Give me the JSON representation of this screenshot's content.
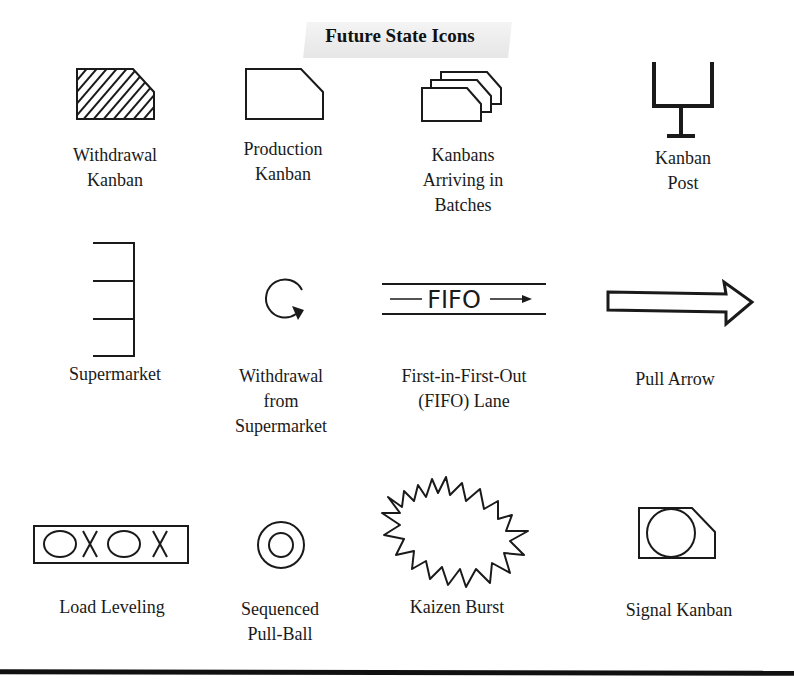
{
  "title": "Future State Icons",
  "icons": [
    {
      "id": "withdrawal-kanban",
      "label_lines": [
        "Withdrawal",
        "Kanban"
      ]
    },
    {
      "id": "production-kanban",
      "label_lines": [
        "Production",
        "Kanban"
      ]
    },
    {
      "id": "kanbans-arriving-in-batches",
      "label_lines": [
        "Kanbans",
        "Arriving in",
        "Batches"
      ]
    },
    {
      "id": "kanban-post",
      "label_lines": [
        "Kanban",
        "Post"
      ]
    },
    {
      "id": "supermarket",
      "label_lines": [
        "Supermarket"
      ]
    },
    {
      "id": "withdrawal-from-supermarket",
      "label_lines": [
        "Withdrawal",
        "from",
        "Supermarket"
      ]
    },
    {
      "id": "fifo-lane",
      "label_lines": [
        "First-in-First-Out",
        "(FIFO) Lane"
      ],
      "glyph_text": "FIFO"
    },
    {
      "id": "pull-arrow",
      "label_lines": [
        "Pull Arrow"
      ]
    },
    {
      "id": "load-leveling",
      "label_lines": [
        "Load Leveling"
      ]
    },
    {
      "id": "sequenced-pull-ball",
      "label_lines": [
        "Sequenced",
        "Pull-Ball"
      ]
    },
    {
      "id": "kaizen-burst",
      "label_lines": [
        "Kaizen Burst"
      ]
    },
    {
      "id": "signal-kanban",
      "label_lines": [
        "Signal Kanban"
      ]
    }
  ],
  "colors": {
    "ink": "#1a1a1a",
    "background": "#ffffff",
    "title_band": "#e8e8e8"
  }
}
